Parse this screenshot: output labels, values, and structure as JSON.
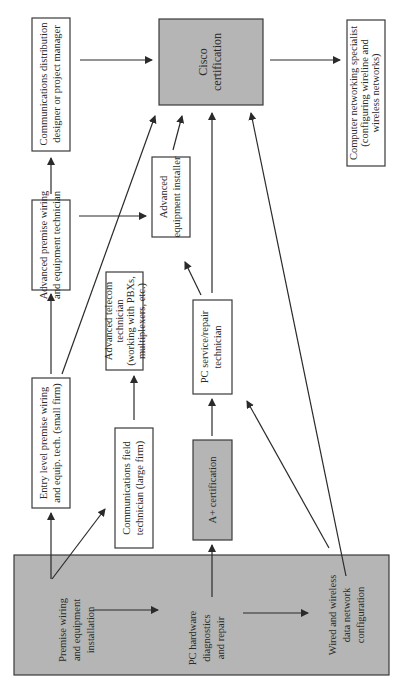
{
  "diagram": {
    "orientation": "rotated 90 degrees counter-clockwise",
    "nodes": {
      "premise": {
        "lines": [
          "Premise wiring",
          "and equipment",
          "installation"
        ],
        "fill": "gray"
      },
      "pc_hw": {
        "lines": [
          "PC hardware",
          "diagnostics",
          "and repair"
        ],
        "fill": "gray"
      },
      "wired": {
        "lines": [
          "Wired and wireless",
          "data network",
          "configuration"
        ],
        "fill": "gray"
      },
      "entry": {
        "lines": [
          "Entry level premise wiring",
          "and equip. tech. (small firm)"
        ],
        "fill": "white"
      },
      "adv_premise": {
        "lines": [
          "Advanced premise wiring",
          "and equipment technician"
        ],
        "fill": "white"
      },
      "comm_dist": {
        "lines": [
          "Communications distribution",
          "designer or project manager"
        ],
        "fill": "white"
      },
      "comm_field": {
        "lines": [
          "Communications field",
          "technician (large firm)"
        ],
        "fill": "white"
      },
      "adv_telecom": {
        "lines": [
          "Advanced telecom",
          "technician",
          "(working with PBXs,",
          "multiplexers, etc.)"
        ],
        "fill": "white"
      },
      "a_plus": {
        "lines": [
          "A+ certification"
        ],
        "fill": "gray"
      },
      "pc_service": {
        "lines": [
          "PC service/repair",
          "technician"
        ],
        "fill": "white"
      },
      "adv_equip": {
        "lines": [
          "Advanced",
          "equipment installer"
        ],
        "fill": "white"
      },
      "cisco": {
        "lines": [
          "Cisco",
          "certification"
        ],
        "fill": "gray"
      },
      "net_specialist": {
        "lines": [
          "Computer networking specialist",
          "(configuring wireline and",
          "wireless networks)"
        ],
        "fill": "white"
      }
    },
    "edges": [
      [
        "premise",
        "entry"
      ],
      [
        "premise",
        "comm_field"
      ],
      [
        "premise",
        "pc_hw"
      ],
      [
        "pc_hw",
        "a_plus"
      ],
      [
        "pc_hw",
        "wired"
      ],
      [
        "entry",
        "adv_premise"
      ],
      [
        "entry",
        "cisco"
      ],
      [
        "adv_premise",
        "comm_dist"
      ],
      [
        "adv_premise",
        "adv_equip"
      ],
      [
        "comm_dist",
        "cisco"
      ],
      [
        "comm_field",
        "adv_telecom"
      ],
      [
        "a_plus",
        "pc_service"
      ],
      [
        "pc_service",
        "adv_equip"
      ],
      [
        "pc_service",
        "cisco"
      ],
      [
        "adv_equip",
        "cisco"
      ],
      [
        "wired",
        "pc_service"
      ],
      [
        "wired",
        "cisco"
      ],
      [
        "cisco",
        "net_specialist"
      ]
    ],
    "colors": {
      "gray_fill": "#b5b5b5",
      "stroke": "#3a3a3a",
      "text": "#2a2a2a"
    }
  }
}
